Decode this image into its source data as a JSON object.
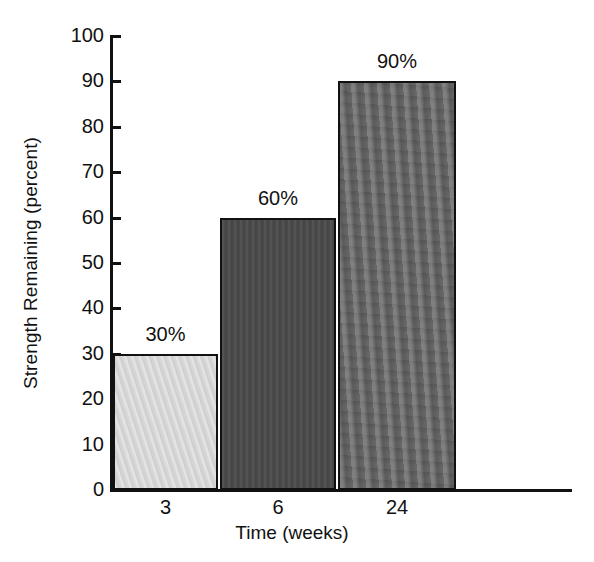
{
  "chart_data": {
    "type": "bar",
    "title": "",
    "xlabel": "Time (weeks)",
    "ylabel": "Strength Remaining (percent)",
    "categories": [
      "3",
      "6",
      "24"
    ],
    "values": [
      30,
      60,
      90
    ],
    "data_labels": [
      "30%",
      "60%",
      "90%"
    ],
    "ylim": [
      0,
      100
    ],
    "ytick_labels": [
      "0",
      "10",
      "20",
      "30",
      "40",
      "50",
      "60",
      "70",
      "80",
      "90",
      "100"
    ],
    "ytick_values": [
      0,
      10,
      20,
      30,
      40,
      50,
      60,
      70,
      80,
      90,
      100
    ],
    "grid": false,
    "legend": false,
    "series": [
      {
        "name": "Strength Remaining",
        "values": [
          30,
          60,
          90
        ]
      }
    ],
    "bar_colors": [
      "#d8d8d8",
      "#4a4a4a",
      "#636363"
    ],
    "bar_edge_color": "#111111",
    "axis_color": "#111111",
    "background_color": "#ffffff"
  }
}
